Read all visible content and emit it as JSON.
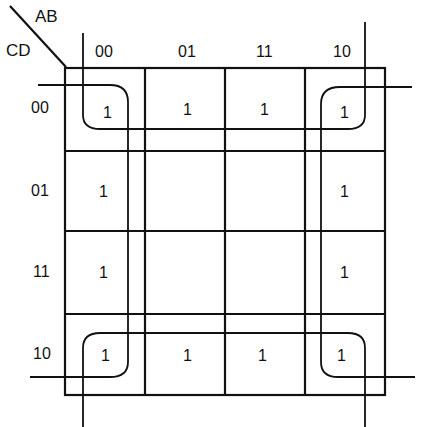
{
  "diagram": {
    "type": "karnaugh-map",
    "row_variable_label": "CD",
    "column_variable_label": "AB",
    "column_labels": [
      "00",
      "01",
      "11",
      "10"
    ],
    "row_labels": [
      "00",
      "01",
      "11",
      "10"
    ],
    "cells": [
      [
        "1",
        "1",
        "1",
        "1"
      ],
      [
        "1",
        "",
        "",
        "1"
      ],
      [
        "1",
        "",
        "",
        "1"
      ],
      [
        "1",
        "1",
        "1",
        "1"
      ]
    ],
    "groupings": [
      {
        "name": "left-column-group",
        "description": "AB=00 column, wraps top and bottom"
      },
      {
        "name": "right-column-group",
        "description": "AB=10 column, wraps top and bottom"
      },
      {
        "name": "top-row-group",
        "description": "CD=00 row, wraps left and right"
      },
      {
        "name": "bottom-row-group",
        "description": "CD=10 row, wraps left and right"
      }
    ],
    "colors": {
      "line": "#111111",
      "background": "#ffffff"
    }
  }
}
